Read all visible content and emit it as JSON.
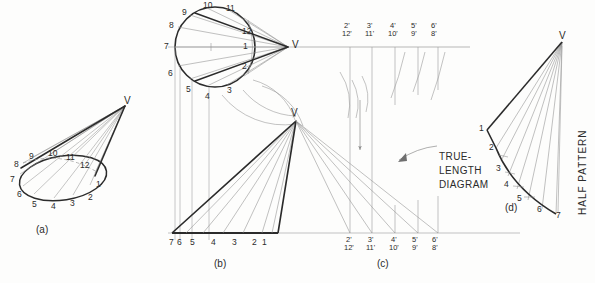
{
  "figure": {
    "ink_color": "#2b2b2b",
    "light_color": "#8d8d8d",
    "paper_color": "#fdfdfc"
  },
  "panels": {
    "a": {
      "caption": "(a)",
      "vertex_label": "V",
      "base_points": [
        "1",
        "2",
        "3",
        "4",
        "5",
        "6",
        "7",
        "8",
        "9",
        "10",
        "11",
        "12"
      ]
    },
    "b": {
      "caption": "(b)",
      "vertex_label_top": "V",
      "vertex_label_front": "V",
      "top_view_points": [
        "1",
        "2",
        "3",
        "4",
        "5",
        "6",
        "7",
        "8",
        "9",
        "10",
        "11",
        "12"
      ],
      "front_base_labels": [
        "7",
        "6",
        "5",
        "4",
        "3",
        "2",
        "1"
      ]
    },
    "c": {
      "caption": "(c)",
      "annotation": "TRUE-\nLENGTH\nDIAGRAM",
      "annotation_lines": [
        "TRUE-",
        "LENGTH",
        "DIAGRAM"
      ],
      "top_labels": [
        {
          "upper": "2'",
          "lower": "12'"
        },
        {
          "upper": "3'",
          "lower": "11'"
        },
        {
          "upper": "4'",
          "lower": "10'"
        },
        {
          "upper": "5'",
          "lower": "9'"
        },
        {
          "upper": "6'",
          "lower": "8'"
        }
      ],
      "bottom_labels": [
        {
          "upper": "2'",
          "lower": "12'"
        },
        {
          "upper": "3'",
          "lower": "11'"
        },
        {
          "upper": "4'",
          "lower": "10'"
        },
        {
          "upper": "5'",
          "lower": "9'"
        },
        {
          "upper": "6'",
          "lower": "8'"
        }
      ]
    },
    "d": {
      "caption": "(d)",
      "vertex_label": "V",
      "note": "HALF PATTERN",
      "pattern_points": [
        "1",
        "2",
        "3",
        "4",
        "5",
        "6",
        "7"
      ]
    }
  }
}
